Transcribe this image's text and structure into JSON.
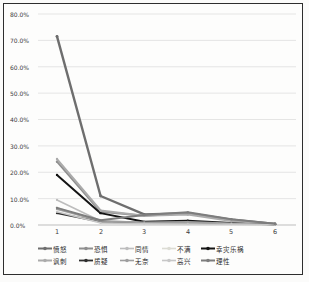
{
  "chart_data": {
    "type": "line",
    "title": "",
    "xlabel": "",
    "ylabel": "",
    "x_labels": [
      "1",
      "2",
      "3",
      "4",
      "5",
      "6"
    ],
    "y_ticks": [
      "80.0%",
      "70.0%",
      "60.0%",
      "50.0%",
      "40.0%",
      "30.0%",
      "20.0%",
      "10.0%",
      "0.0%"
    ],
    "ylim": [
      0,
      80
    ],
    "grid": true,
    "legend_position": "bottom",
    "gridline_color": "#dadada",
    "axis_line_color": "#bdbdbd",
    "series": [
      {
        "name": "愤怒",
        "color": "#6e6e6e",
        "width": 2.4,
        "values": [
          71.5,
          11.0,
          4.0,
          4.5,
          2.0,
          0.4
        ]
      },
      {
        "name": "恐惧",
        "color": "#8f8f8f",
        "width": 2.0,
        "values": [
          24.0,
          5.0,
          3.5,
          4.5,
          1.8,
          0.4
        ]
      },
      {
        "name": "同情",
        "color": "#bdbdbd",
        "width": 1.6,
        "values": [
          9.5,
          1.5,
          1.0,
          0.8,
          0.5,
          0.2
        ]
      },
      {
        "name": "不满",
        "color": "#dcdcd4",
        "width": 1.6,
        "values": [
          6.5,
          1.0,
          0.7,
          0.5,
          0.3,
          0.1
        ]
      },
      {
        "name": "幸灾乐祸",
        "color": "#141414",
        "width": 2.0,
        "values": [
          19.0,
          4.5,
          1.2,
          1.6,
          0.8,
          0.3
        ]
      },
      {
        "name": "讽刺",
        "color": "#ababab",
        "width": 2.0,
        "values": [
          25.0,
          5.5,
          3.5,
          4.0,
          1.5,
          0.4
        ]
      },
      {
        "name": "质疑",
        "color": "#2e2e2e",
        "width": 1.8,
        "values": [
          4.5,
          1.2,
          0.8,
          1.0,
          0.5,
          0.2
        ]
      },
      {
        "name": "无奈",
        "color": "#9e9e9e",
        "width": 1.6,
        "values": [
          6.0,
          1.5,
          1.0,
          1.2,
          0.6,
          0.2
        ]
      },
      {
        "name": "高兴",
        "color": "#c7c7c7",
        "width": 1.6,
        "values": [
          5.0,
          0.8,
          0.5,
          0.4,
          0.3,
          0.1
        ]
      },
      {
        "name": "理性",
        "color": "#7d7d7d",
        "width": 2.0,
        "values": [
          6.5,
          1.8,
          3.8,
          4.8,
          2.2,
          0.5
        ]
      }
    ]
  }
}
